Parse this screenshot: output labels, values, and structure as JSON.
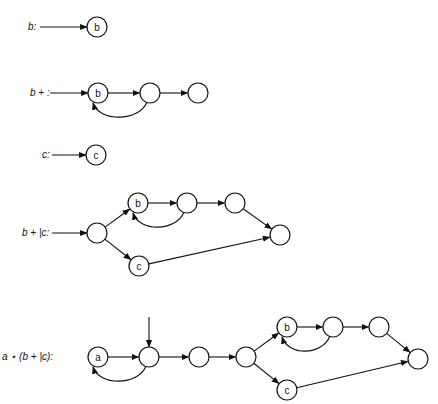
{
  "node_radius": 10,
  "colors": {
    "stroke": "#111111",
    "background": "#ffffff"
  },
  "diagrams": [
    {
      "id": "b",
      "label": "b:",
      "label_pos": [
        28,
        30
      ],
      "start_arrow": [
        [
          40,
          27
        ],
        [
          87,
          27
        ]
      ],
      "nodes": [
        {
          "id": "n0",
          "x": 97,
          "y": 27,
          "text": "b"
        }
      ],
      "edges": []
    },
    {
      "id": "b-plus",
      "label": "b + :",
      "label_pos": [
        30,
        96
      ],
      "start_arrow": [
        [
          50,
          93
        ],
        [
          88,
          93
        ]
      ],
      "nodes": [
        {
          "id": "n0",
          "x": 98,
          "y": 93,
          "text": "b"
        },
        {
          "id": "n1",
          "x": 150,
          "y": 93,
          "text": ""
        },
        {
          "id": "n2",
          "x": 198,
          "y": 93,
          "text": ""
        }
      ],
      "edges": [
        {
          "from": "n0",
          "to": "n1",
          "type": "straight"
        },
        {
          "from": "n1",
          "to": "n2",
          "type": "straight"
        },
        {
          "from": "n1",
          "to": "n0",
          "type": "loop-below"
        }
      ]
    },
    {
      "id": "c",
      "label": "c:",
      "label_pos": [
        42,
        158
      ],
      "start_arrow": [
        [
          52,
          155
        ],
        [
          86,
          155
        ]
      ],
      "nodes": [
        {
          "id": "n0",
          "x": 96,
          "y": 155,
          "text": "c"
        }
      ],
      "edges": []
    },
    {
      "id": "b-plus-or-c",
      "label": "b + |c:",
      "label_pos": [
        22,
        236
      ],
      "start_arrow": [
        [
          52,
          233
        ],
        [
          87,
          233
        ]
      ],
      "nodes": [
        {
          "id": "n0",
          "x": 97,
          "y": 233,
          "text": ""
        },
        {
          "id": "n1",
          "x": 138,
          "y": 203,
          "text": "b"
        },
        {
          "id": "n2",
          "x": 187,
          "y": 203,
          "text": ""
        },
        {
          "id": "n3",
          "x": 235,
          "y": 203,
          "text": ""
        },
        {
          "id": "n4",
          "x": 139,
          "y": 266,
          "text": "c"
        },
        {
          "id": "n5",
          "x": 280,
          "y": 235,
          "text": ""
        }
      ],
      "edges": [
        {
          "from": "n0",
          "to": "n1",
          "type": "straight"
        },
        {
          "from": "n0",
          "to": "n4",
          "type": "straight"
        },
        {
          "from": "n1",
          "to": "n2",
          "type": "straight"
        },
        {
          "from": "n2",
          "to": "n3",
          "type": "straight"
        },
        {
          "from": "n2",
          "to": "n1",
          "type": "loop-below"
        },
        {
          "from": "n3",
          "to": "n5",
          "type": "straight"
        },
        {
          "from": "n4",
          "to": "n5",
          "type": "straight"
        }
      ]
    },
    {
      "id": "a-star-b-plus-or-c",
      "label": "a ⋆ (b + |c):",
      "label_pos": [
        2,
        360
      ],
      "start_arrow": [
        [
          149,
          317
        ],
        [
          149,
          347
        ]
      ],
      "nodes": [
        {
          "id": "n0",
          "x": 98,
          "y": 357,
          "text": "a"
        },
        {
          "id": "n1",
          "x": 149,
          "y": 357,
          "text": ""
        },
        {
          "id": "n2",
          "x": 199,
          "y": 357,
          "text": ""
        },
        {
          "id": "n3",
          "x": 246,
          "y": 357,
          "text": ""
        },
        {
          "id": "n4",
          "x": 287,
          "y": 327,
          "text": "b"
        },
        {
          "id": "n5",
          "x": 333,
          "y": 327,
          "text": ""
        },
        {
          "id": "n6",
          "x": 379,
          "y": 327,
          "text": ""
        },
        {
          "id": "n7",
          "x": 287,
          "y": 390,
          "text": "c"
        },
        {
          "id": "n8",
          "x": 418,
          "y": 359,
          "text": ""
        }
      ],
      "edges": [
        {
          "from": "n0",
          "to": "n1",
          "type": "straight"
        },
        {
          "from": "n1",
          "to": "n0",
          "type": "loop-below"
        },
        {
          "from": "n1",
          "to": "n2",
          "type": "straight"
        },
        {
          "from": "n2",
          "to": "n3",
          "type": "straight"
        },
        {
          "from": "n3",
          "to": "n4",
          "type": "straight"
        },
        {
          "from": "n3",
          "to": "n7",
          "type": "straight"
        },
        {
          "from": "n4",
          "to": "n5",
          "type": "straight"
        },
        {
          "from": "n5",
          "to": "n4",
          "type": "loop-below"
        },
        {
          "from": "n5",
          "to": "n6",
          "type": "straight"
        },
        {
          "from": "n6",
          "to": "n8",
          "type": "straight"
        },
        {
          "from": "n7",
          "to": "n8",
          "type": "straight"
        }
      ]
    }
  ]
}
